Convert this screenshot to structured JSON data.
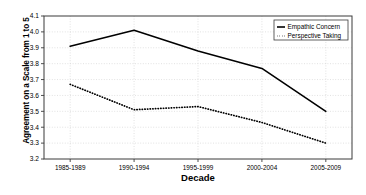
{
  "chart_data": {
    "type": "line",
    "title": "",
    "xlabel": "Decade",
    "ylabel": "Agreement on a Scale from 1 to 5",
    "categories": [
      "1985-1989",
      "1990-1994",
      "1995-1999",
      "2000-2004",
      "2005-2009"
    ],
    "ylim": [
      3.2,
      4.1
    ],
    "yticks": [
      "3.2",
      "3.3",
      "3.4",
      "3.5",
      "3.6",
      "3.7",
      "3.8",
      "3.9",
      "4.0",
      "4.1"
    ],
    "grid": true,
    "legend_position": "top-right",
    "series": [
      {
        "name": "Empathic Concern",
        "style": "solid",
        "color": "#000000",
        "values": [
          3.91,
          4.01,
          3.88,
          3.77,
          3.5
        ]
      },
      {
        "name": "Perspective Taking",
        "style": "dotted",
        "color": "#000000",
        "values": [
          3.67,
          3.51,
          3.53,
          3.43,
          3.3
        ]
      }
    ]
  },
  "axes": {
    "x_title": "Decade",
    "y_title": "Agreement on a Scale from 1 to 5"
  },
  "legend": {
    "items": [
      {
        "label": "Empathic Concern"
      },
      {
        "label": "Perspective Taking"
      }
    ]
  },
  "colors": {
    "frame": "#3b3b3b",
    "grid": "#cfcfcf",
    "series": "#000000",
    "background": "#ffffff"
  }
}
